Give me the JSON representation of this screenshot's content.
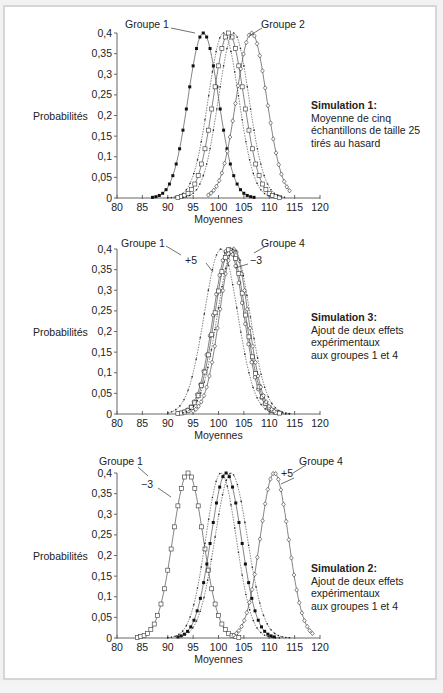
{
  "chart_data": [
    {
      "type": "line",
      "title": "Simulation 1",
      "subtitle": "Moyenne de cinq échantillons de taille 25 tirés au hasard",
      "xlabel": "Moyennes",
      "ylabel": "Probabilités",
      "xlim": [
        80,
        120
      ],
      "ylim": [
        0,
        0.4
      ],
      "xticks": [
        80,
        85,
        90,
        95,
        100,
        105,
        110,
        115,
        120
      ],
      "yticks": [
        "0",
        "0,05",
        "0,1",
        "0,15",
        "0,2",
        "0,25",
        "0,3",
        "0,35",
        "0,4"
      ],
      "grid": false,
      "series": [
        {
          "name": "Groupe 1",
          "mean": 97,
          "sd": 3,
          "marker": "filled-square",
          "range": [
            87,
            107
          ]
        },
        {
          "name": "Groupe (dots A)",
          "mean": 101,
          "sd": 3,
          "marker": "dot",
          "range": [
            90,
            112
          ]
        },
        {
          "name": "Groupe (squares)",
          "mean": 102,
          "sd": 3,
          "marker": "open-square",
          "range": [
            92,
            112
          ]
        },
        {
          "name": "Groupe (dots B)",
          "mean": 103,
          "sd": 3,
          "marker": "dot",
          "range": [
            93,
            113
          ]
        },
        {
          "name": "Groupe 2",
          "mean": 106.5,
          "sd": 3,
          "marker": "open-diamond",
          "range": [
            98,
            114
          ]
        }
      ],
      "annotations": [
        {
          "text": "Groupe 1",
          "x": 97,
          "y": 0.4
        },
        {
          "text": "Groupe 2",
          "x": 106.5,
          "y": 0.4
        }
      ]
    },
    {
      "type": "line",
      "title": "Simulation 3",
      "subtitle": "Ajout de deux effets expérimentaux aux groupes 1 et 4",
      "xlabel": "Moyennes",
      "ylabel": "Probabilités",
      "xlim": [
        80,
        120
      ],
      "ylim": [
        0,
        0.4
      ],
      "xticks": [
        80,
        85,
        90,
        95,
        100,
        105,
        110,
        115,
        120
      ],
      "yticks": [
        "0",
        "0,05",
        "0,1",
        "0,15",
        "0,2",
        "0,25",
        "0,3",
        "0,35",
        "0,4"
      ],
      "grid": false,
      "series": [
        {
          "name": "Groupe (dots wide)",
          "mean": 100.5,
          "sd": 3.3,
          "marker": "dot",
          "range": [
            90,
            114
          ]
        },
        {
          "name": "Groupe 1 (+5)",
          "mean": 102,
          "sd": 3,
          "marker": "open-circle",
          "range": [
            92,
            111
          ]
        },
        {
          "name": "Groupe (squares)",
          "mean": 102.3,
          "sd": 3,
          "marker": "open-square",
          "range": [
            92,
            112
          ]
        },
        {
          "name": "Groupe 4 (−3)",
          "mean": 103,
          "sd": 2.8,
          "marker": "open-diamond",
          "range": [
            95,
            111
          ]
        },
        {
          "name": "Groupe (dots B)",
          "mean": 103,
          "sd": 3.2,
          "marker": "dot",
          "range": [
            93,
            114
          ]
        }
      ],
      "annotations": [
        {
          "text": "Groupe 1",
          "x": 99,
          "y": 0.39
        },
        {
          "text": "+5",
          "x": 98,
          "y": 0.37
        },
        {
          "text": "Groupe 4",
          "x": 104,
          "y": 0.39
        },
        {
          "text": "−3",
          "x": 104.5,
          "y": 0.36
        }
      ]
    },
    {
      "type": "line",
      "title": "Simulation 2",
      "subtitle": "Ajout de deux effets expérimentaux aux groupes 1 et 4",
      "xlabel": "Moyennes",
      "ylabel": "Probabilités",
      "xlim": [
        80,
        120
      ],
      "ylim": [
        0,
        0.4
      ],
      "xticks": [
        80,
        85,
        90,
        95,
        100,
        105,
        110,
        115,
        120
      ],
      "yticks": [
        "0",
        "0,05",
        "0,1",
        "0,15",
        "0,2",
        "0,25",
        "0,3",
        "0,35",
        "0,4"
      ],
      "grid": false,
      "series": [
        {
          "name": "Groupe 1 (−3)",
          "mean": 94,
          "sd": 3,
          "marker": "open-square",
          "range": [
            84,
            104
          ]
        },
        {
          "name": "Groupe (dots A)",
          "mean": 100.5,
          "sd": 3,
          "marker": "dot",
          "range": [
            90,
            112
          ]
        },
        {
          "name": "Groupe (filled squares)",
          "mean": 101.5,
          "sd": 3,
          "marker": "filled-square",
          "range": [
            92,
            111
          ]
        },
        {
          "name": "Groupe (dots B)",
          "mean": 102.5,
          "sd": 3.2,
          "marker": "dot",
          "range": [
            92,
            114
          ]
        },
        {
          "name": "Groupe 4 (+5)",
          "mean": 111,
          "sd": 2.8,
          "marker": "open-diamond",
          "range": [
            103,
            118.5
          ]
        }
      ],
      "annotations": [
        {
          "text": "Groupe 1",
          "x": 94,
          "y": 0.4
        },
        {
          "text": "−3",
          "x": 92,
          "y": 0.34
        },
        {
          "text": "Groupe 4",
          "x": 111,
          "y": 0.4
        },
        {
          "text": "+5",
          "x": 112,
          "y": 0.34
        }
      ]
    }
  ],
  "charts": [
    {
      "ylabel": "Probabilités",
      "xlabel": "Moyennes",
      "note_title": "Simulation 1:",
      "note_lines": [
        "Moyenne de cinq",
        "échantillons de taille 25",
        "tirés au hasard"
      ],
      "labels": [
        {
          "text": "Groupe 1",
          "x": 147,
          "y": 28
        },
        {
          "text": "Groupe 2",
          "x": 283,
          "y": 28
        }
      ]
    },
    {
      "ylabel": "Probabilités",
      "xlabel": "Moyennes",
      "note_title": "Simulation 3:",
      "note_lines": [
        "Ajout de deux effets",
        "expérimentaux",
        "aux groupes 1 et 4"
      ],
      "labels": [
        {
          "text": "Groupe 1",
          "x": 143,
          "y": 31
        },
        {
          "text": "+5",
          "x": 191,
          "y": 48
        },
        {
          "text": "Groupe 4",
          "x": 283,
          "y": 31
        },
        {
          "text": "−3",
          "x": 256,
          "y": 48
        }
      ]
    },
    {
      "ylabel": "Probabilités",
      "xlabel": "Moyennes",
      "note_title": "Simulation 2:",
      "note_lines": [
        "Ajout de deux effets",
        "expérimentaux",
        "aux groupes 1 et 4"
      ],
      "labels": [
        {
          "text": "Groupe 1",
          "x": 121,
          "y": 25
        },
        {
          "text": "−3",
          "x": 147,
          "y": 48
        },
        {
          "text": "Groupe 4",
          "x": 321,
          "y": 25
        },
        {
          "text": "+5",
          "x": 287,
          "y": 37
        }
      ]
    }
  ],
  "colors": {
    "ink": "#222222",
    "frame": "#d6d6d6",
    "background": "#ffffff"
  }
}
